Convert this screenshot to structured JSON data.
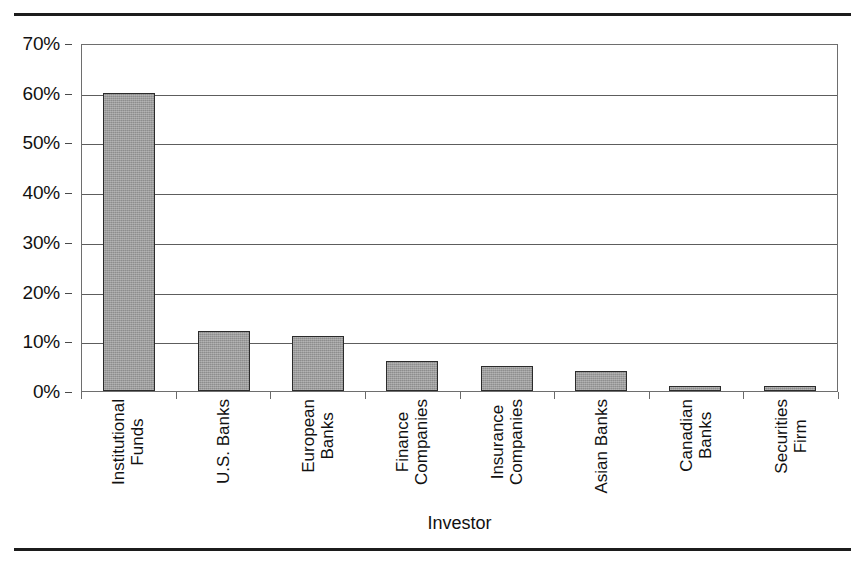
{
  "figure": {
    "background_color": "#ffffff",
    "rule_color": "#1c1c1c",
    "plot_border_color": "#6e6e6e",
    "gridline_color": "#5d5d5d",
    "bar_fill_color": "#9b9b9b",
    "bar_border_color": "#2b2b2b"
  },
  "chart_data": {
    "type": "bar",
    "title": "",
    "subtitle": "",
    "xlabel": "Investor",
    "ylabel": "",
    "categories": [
      "Institutional Funds",
      "U.S. Banks",
      "European Banks",
      "Finance Companies",
      "Insurance Companies",
      "Asian Banks",
      "Canadian Banks",
      "Securities Firm"
    ],
    "category_lines": [
      [
        "Institutional",
        "Funds"
      ],
      [
        "U.S. Banks",
        ""
      ],
      [
        "European",
        "Banks"
      ],
      [
        "Finance",
        "Companies"
      ],
      [
        "Insurance",
        "Companies"
      ],
      [
        "Asian Banks",
        ""
      ],
      [
        "Canadian",
        "Banks"
      ],
      [
        "Securities",
        "Firm"
      ]
    ],
    "values": [
      60,
      12,
      11,
      6,
      5,
      4,
      1,
      1
    ],
    "value_unit": "%",
    "ylim": [
      0,
      70
    ],
    "ytick_values": [
      0,
      10,
      20,
      30,
      40,
      50,
      60,
      70
    ],
    "ytick_labels": [
      "0%",
      "10%",
      "20%",
      "30%",
      "40%",
      "50%",
      "60%",
      "70%"
    ],
    "grid": true,
    "grid_axis": "y",
    "legend": false,
    "legend_position": "none",
    "series": [
      {
        "name": "Share of investors",
        "values": [
          60,
          12,
          11,
          6,
          5,
          4,
          1,
          1
        ]
      }
    ]
  }
}
